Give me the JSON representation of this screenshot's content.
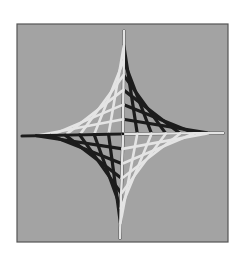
{
  "image": {
    "subject": "string art astroid star",
    "description": "Photograph of a four-pointed star (astroid) made of black and white yarn stretched across a gray board",
    "colors": {
      "background": "#ffffff",
      "board": "#a3a3a3",
      "board_border": "#555555",
      "dark_thread": "#1c1c1c",
      "light_thread": "#e4e4e4",
      "center_dot": "#111111"
    },
    "quadrants": [
      {
        "name": "top-right",
        "thread": "dark"
      },
      {
        "name": "top-left",
        "thread": "light"
      },
      {
        "name": "bottom-left",
        "thread": "dark"
      },
      {
        "name": "bottom-right",
        "thread": "light"
      }
    ],
    "strands_per_quadrant": 7
  }
}
